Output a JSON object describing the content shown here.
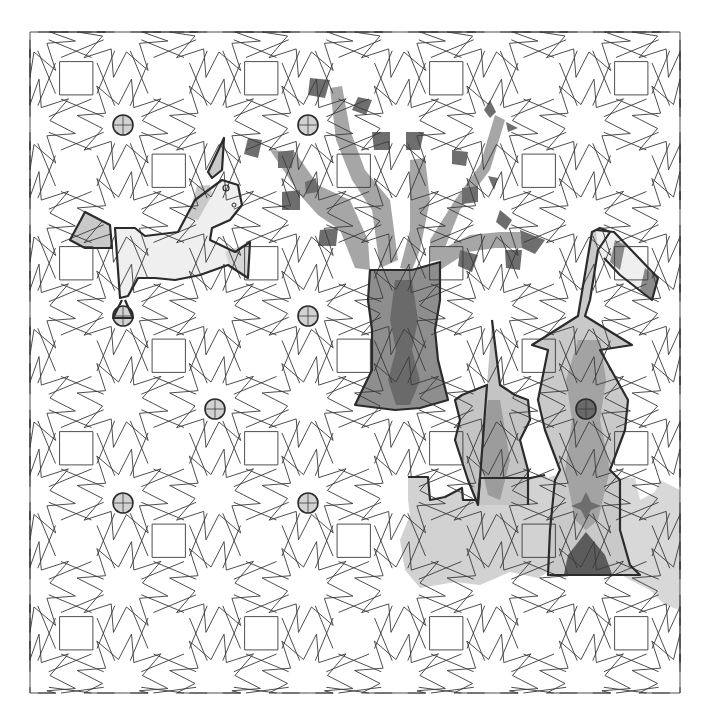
{
  "title": "Tiling pattern illustration",
  "colors": {
    "background": "#ffffff",
    "line": "#3a3a3a",
    "outline": "#2b2b2b",
    "very_light": "#efefef",
    "light": "#d2d2d2",
    "medium": "#b5b5b5",
    "mid_dark": "#8e8e8e",
    "dark": "#6a6a6a",
    "darkest": "#4f4f4f"
  },
  "pattern": {
    "left": 30,
    "top": 32,
    "right": 680,
    "bottom": 693,
    "cell": 92.5
  },
  "dots": [
    {
      "x": 123,
      "y": 125,
      "shade": "light"
    },
    {
      "x": 308,
      "y": 125,
      "shade": "light"
    },
    {
      "x": 123,
      "y": 316,
      "shade": "light"
    },
    {
      "x": 308,
      "y": 316,
      "shade": "light"
    },
    {
      "x": 215,
      "y": 409,
      "shade": "light"
    },
    {
      "x": 123,
      "y": 503,
      "shade": "light"
    },
    {
      "x": 308,
      "y": 503,
      "shade": "light"
    },
    {
      "x": 586,
      "y": 409,
      "shade": "dark"
    }
  ],
  "figures": [
    {
      "name": "unicorn",
      "label": "Unicorn"
    },
    {
      "name": "tree",
      "label": "Tree"
    },
    {
      "name": "castle",
      "label": "Castle"
    }
  ]
}
